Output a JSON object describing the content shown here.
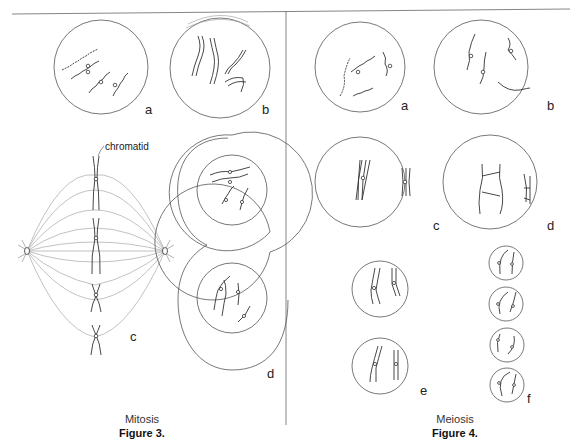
{
  "figure3": {
    "caption": "Mitosis",
    "title": "Figure 3.",
    "annotation": "chromatid",
    "panels": [
      {
        "label": "a"
      },
      {
        "label": "b"
      },
      {
        "label": "c"
      },
      {
        "label": "d"
      }
    ]
  },
  "figure4": {
    "caption": "Meiosis",
    "title": "Figure 4.",
    "panels": [
      {
        "label": "a"
      },
      {
        "label": "b"
      },
      {
        "label": "c"
      },
      {
        "label": "d"
      },
      {
        "label": "e"
      },
      {
        "label": "f"
      }
    ]
  }
}
